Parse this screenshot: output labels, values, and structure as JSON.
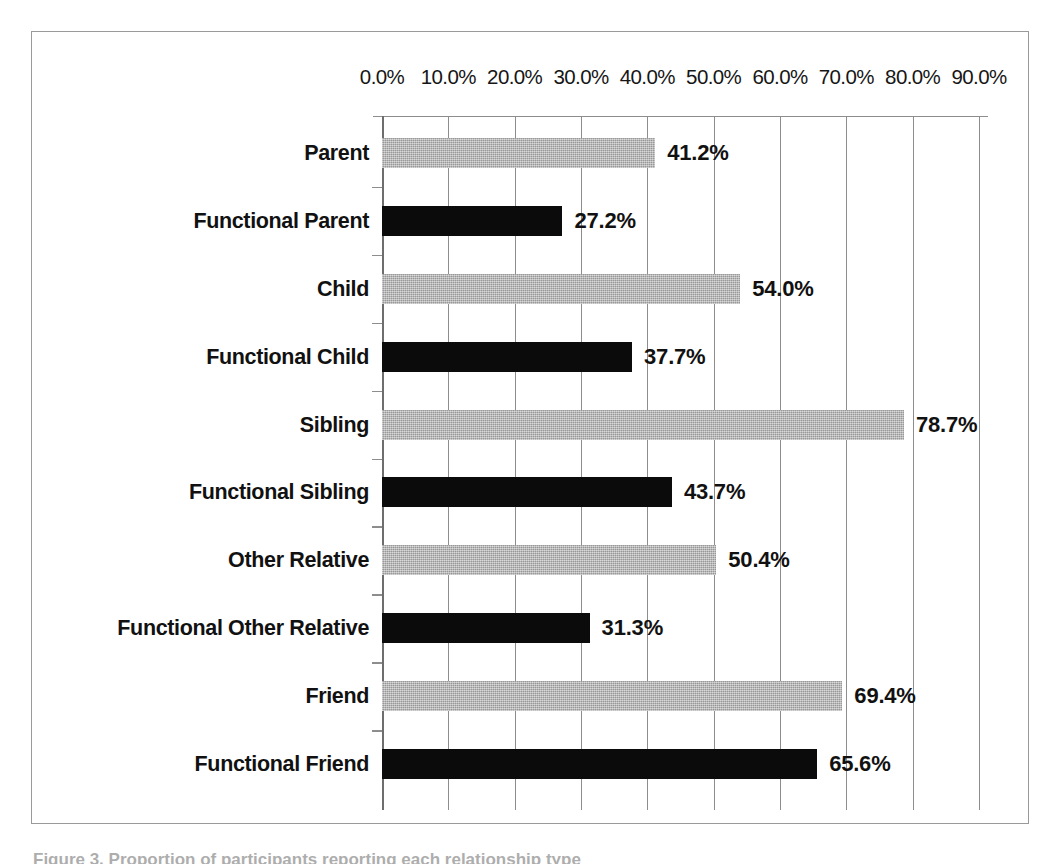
{
  "chart_data": {
    "type": "bar",
    "orientation": "horizontal",
    "title": "",
    "xlabel": "",
    "ylabel": "",
    "xlim": [
      0,
      90
    ],
    "grid": true,
    "legend": "none",
    "xtick_labels": [
      "0.0%",
      "10.0%",
      "20.0%",
      "30.0%",
      "40.0%",
      "50.0%",
      "60.0%",
      "70.0%",
      "80.0%",
      "90.0%"
    ],
    "xtick_values": [
      0,
      10,
      20,
      30,
      40,
      50,
      60,
      70,
      80,
      90
    ],
    "categories": [
      "Parent",
      "Functional Parent",
      "Child",
      "Functional Child",
      "Sibling",
      "Functional Sibling",
      "Other Relative",
      "Functional Other Relative",
      "Friend",
      "Functional Friend"
    ],
    "values": [
      41.2,
      27.2,
      54.0,
      37.7,
      78.7,
      43.7,
      50.4,
      31.3,
      69.4,
      65.6
    ],
    "value_labels": [
      "41.2%",
      "27.2%",
      "54.0%",
      "37.7%",
      "78.7%",
      "43.7%",
      "50.4%",
      "31.3%",
      "69.4%",
      "65.6%"
    ],
    "bar_colors": [
      "#a9a9a9",
      "#0b0b0b",
      "#a9a9a9",
      "#0b0b0b",
      "#a9a9a9",
      "#0b0b0b",
      "#a9a9a9",
      "#0b0b0b",
      "#a9a9a9",
      "#0b0b0b"
    ],
    "series_styles": [
      "gray",
      "black",
      "gray",
      "black",
      "gray",
      "black",
      "gray",
      "black",
      "gray",
      "black"
    ],
    "colors": {
      "gray_bar": "#a9a9a9",
      "black_bar": "#0b0b0b",
      "gridline": "#8d8d8d",
      "frame": "#9a9a9a",
      "text": "#111111",
      "background": "#ffffff"
    }
  },
  "caption": {
    "text": "Figure 3. Proportion of participants reporting each relationship type"
  }
}
